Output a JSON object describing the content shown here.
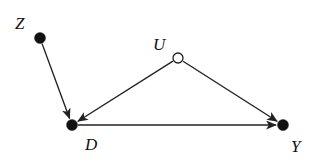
{
  "diagram": {
    "type": "causal-dag",
    "nodes": [
      {
        "id": "Z",
        "label": "Z",
        "x": 40,
        "y": 38,
        "observed": true,
        "label_x": 15,
        "label_y": 15
      },
      {
        "id": "U",
        "label": "U",
        "x": 178,
        "y": 58,
        "observed": false,
        "label_x": 153,
        "label_y": 36
      },
      {
        "id": "D",
        "label": "D",
        "x": 72,
        "y": 125,
        "observed": true,
        "label_x": 85,
        "label_y": 136
      },
      {
        "id": "Y",
        "label": "Y",
        "x": 283,
        "y": 125,
        "observed": true,
        "label_x": 291,
        "label_y": 138
      }
    ],
    "edges": [
      {
        "from": "Z",
        "to": "D"
      },
      {
        "from": "U",
        "to": "D"
      },
      {
        "from": "U",
        "to": "Y"
      },
      {
        "from": "D",
        "to": "Y"
      }
    ],
    "colors": {
      "line": "#222222",
      "node_fill": "#111111",
      "open_node_fill": "#ffffff"
    }
  }
}
